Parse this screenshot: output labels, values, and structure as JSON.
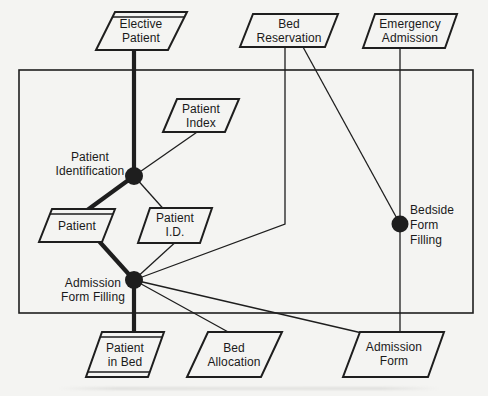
{
  "diagram_type": "data-flow-diagram",
  "colors": {
    "ink": "#1e1e1e",
    "background": "#f4f4f2"
  },
  "nodes": {
    "elective_patient": {
      "lines": [
        "Elective",
        "Patient"
      ],
      "shape": "parallelogram-double-top"
    },
    "bed_reservation": {
      "lines": [
        "Bed",
        "Reservation"
      ],
      "shape": "parallelogram"
    },
    "emergency_admission": {
      "lines": [
        "Emergency",
        "Admission"
      ],
      "shape": "parallelogram"
    },
    "patient_index": {
      "lines": [
        "Patient",
        "Index"
      ],
      "shape": "parallelogram"
    },
    "patient": {
      "lines": [
        "Patient"
      ],
      "shape": "parallelogram-double-top"
    },
    "patient_id": {
      "lines": [
        "Patient",
        "I.D."
      ],
      "shape": "parallelogram"
    },
    "patient_in_bed": {
      "lines": [
        "Patient",
        "in Bed"
      ],
      "shape": "parallelogram-double-top-bottom"
    },
    "bed_allocation": {
      "lines": [
        "Bed",
        "Allocation"
      ],
      "shape": "parallelogram"
    },
    "admission_form": {
      "lines": [
        "Admission",
        "Form"
      ],
      "shape": "parallelogram"
    }
  },
  "processes": {
    "patient_identification": {
      "lines": [
        "Patient",
        "Identification"
      ]
    },
    "admission_form_filling": {
      "lines": [
        "Admission",
        "Form Filling"
      ]
    },
    "bedside_form_filling": {
      "lines": [
        "Bedside",
        "Form",
        "Filling"
      ]
    }
  }
}
